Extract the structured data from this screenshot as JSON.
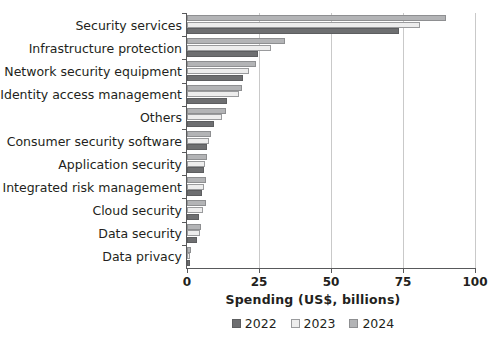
{
  "chart_data": {
    "type": "bar",
    "orientation": "horizontal",
    "title": "",
    "xlabel": "Spending (US$, billions)",
    "ylabel": "",
    "xlim": [
      0,
      100
    ],
    "xticks": [
      0,
      25,
      50,
      75,
      100
    ],
    "xticklabels": [
      "0",
      "25",
      "50",
      "75",
      "100"
    ],
    "grid": "vertical",
    "legend_position": "bottom",
    "categories": [
      "Security services",
      "Infrastructure protection",
      "Network security equipment",
      "Identity access management",
      "Others",
      "Consumer security software",
      "Application security",
      "Integrated risk management",
      "Cloud security",
      "Data security",
      "Data privacy"
    ],
    "series": [
      {
        "name": "2022",
        "color": "#6e6f71",
        "values": [
          73.5,
          24.7,
          19.5,
          14.0,
          9.5,
          7.0,
          5.8,
          5.3,
          4.3,
          3.3,
          0.9
        ]
      },
      {
        "name": "2023",
        "color": "#ededed",
        "values": [
          81.0,
          29.0,
          21.5,
          18.0,
          12.0,
          7.8,
          6.3,
          6.0,
          5.5,
          4.4,
          1.2
        ]
      },
      {
        "name": "2024",
        "color": "#b3b4b6",
        "values": [
          90.0,
          34.0,
          24.0,
          19.0,
          13.5,
          8.2,
          6.8,
          6.5,
          6.7,
          4.9,
          1.5
        ]
      }
    ]
  },
  "legend": {
    "items": [
      {
        "label": "2022",
        "key": "y2022"
      },
      {
        "label": "2023",
        "key": "y2023"
      },
      {
        "label": "2024",
        "key": "y2024"
      }
    ]
  },
  "colors": {
    "series_2022": "#6e6f71",
    "series_2023": "#ededed",
    "series_2024": "#b3b4b6",
    "axis": "#58595b",
    "grid": "#c9c9c9",
    "text": "#231f20",
    "background": "#ffffff"
  }
}
